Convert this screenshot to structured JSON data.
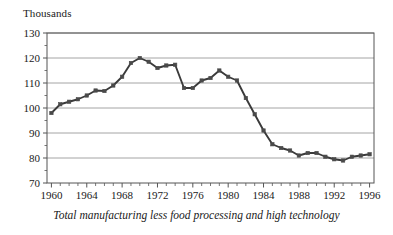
{
  "figure": {
    "units_label": "Thousands",
    "caption": "Total manufacturing less food processing and high technology"
  },
  "style": {
    "line_color": "#3a3a3a",
    "marker_color": "#4a4a4a",
    "grid_color": "#9a9a9a",
    "axis_color": "#555555",
    "background": "#ffffff"
  },
  "chart_data": {
    "type": "line",
    "title": "",
    "subtitle": "",
    "caption": "Total manufacturing less food processing and high technology",
    "xlabel": "",
    "ylabel": "Thousands",
    "ylim": [
      70,
      130
    ],
    "xlim": [
      1959.5,
      1996.5
    ],
    "ytick_values": [
      70,
      80,
      90,
      100,
      110,
      120,
      130
    ],
    "ytick_labels": [
      "70",
      "80",
      "90",
      "100",
      "110",
      "120",
      "130"
    ],
    "xtick_values": [
      1960,
      1964,
      1968,
      1972,
      1976,
      1980,
      1984,
      1988,
      1992,
      1996
    ],
    "xtick_labels": [
      "1960",
      "1964",
      "1968",
      "1972",
      "1976",
      "1980",
      "1984",
      "1988",
      "1992",
      "1996"
    ],
    "minor_xticks_every": 1,
    "grid": "horizontal",
    "legend": "none",
    "marker": "square",
    "x": [
      1960,
      1961,
      1962,
      1963,
      1964,
      1965,
      1966,
      1967,
      1968,
      1969,
      1970,
      1971,
      1972,
      1973,
      1974,
      1975,
      1976,
      1977,
      1978,
      1979,
      1980,
      1981,
      1982,
      1983,
      1984,
      1985,
      1986,
      1987,
      1988,
      1989,
      1990,
      1991,
      1992,
      1993,
      1994,
      1995,
      1996
    ],
    "values": [
      98.0,
      101.5,
      102.5,
      103.5,
      105.0,
      107.0,
      106.8,
      109.0,
      112.5,
      118.0,
      120.0,
      118.5,
      116.0,
      117.0,
      117.3,
      108.0,
      108.0,
      111.0,
      112.0,
      115.0,
      112.5,
      111.0,
      104.0,
      97.5,
      91.0,
      85.5,
      84.0,
      83.0,
      81.0,
      82.0,
      82.0,
      80.5,
      79.5,
      79.0,
      80.5,
      81.0,
      81.5
    ],
    "series": [
      {
        "name": "Total manufacturing less food processing and high technology",
        "values": [
          98.0,
          101.5,
          102.5,
          103.5,
          105.0,
          107.0,
          106.8,
          109.0,
          112.5,
          118.0,
          120.0,
          118.5,
          116.0,
          117.0,
          117.3,
          108.0,
          108.0,
          111.0,
          112.0,
          115.0,
          112.5,
          111.0,
          104.0,
          97.5,
          91.0,
          85.5,
          84.0,
          83.0,
          81.0,
          82.0,
          82.0,
          80.5,
          79.5,
          79.0,
          80.5,
          81.0,
          81.5
        ]
      }
    ]
  }
}
